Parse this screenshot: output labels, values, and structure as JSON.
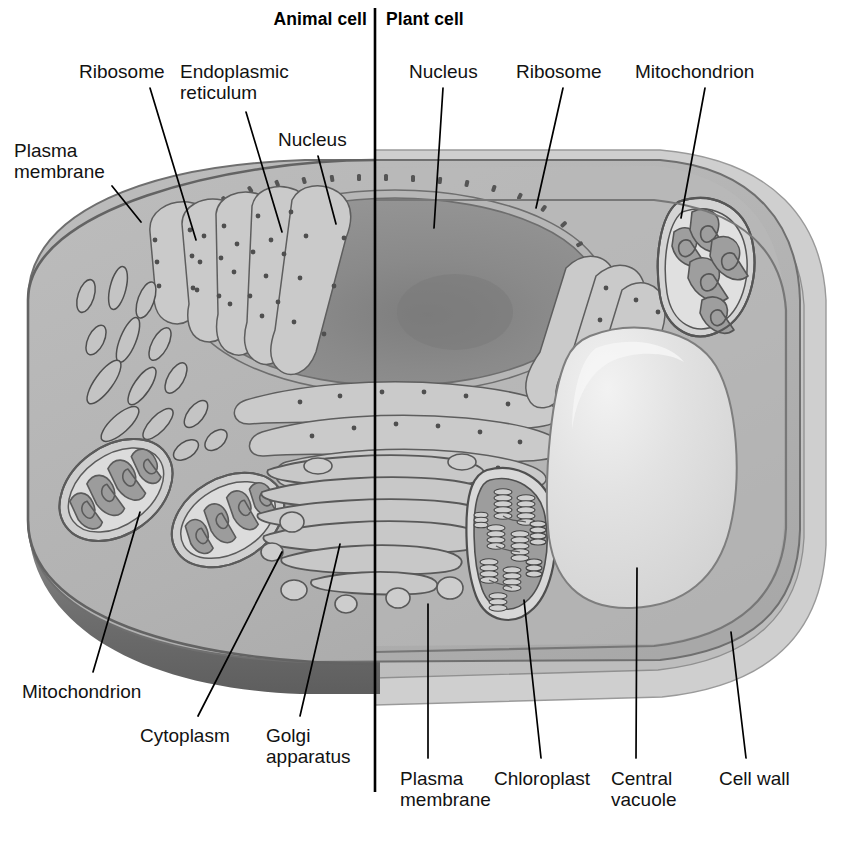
{
  "figure": {
    "title_left": "Animal cell",
    "title_right": "Plant cell",
    "divider": "vertical-divider-line",
    "type": "labeled biological diagram"
  },
  "colors": {
    "background": "#ffffff",
    "text": "#121212",
    "leader_line": "#000000",
    "cytoplasm": "#b3b3b3",
    "cytoplasm_light": "#c2c2c2",
    "organelle_fill": "#a2a2a2",
    "organelle_dark": "#8e8e8e",
    "nucleus": "#8e8e8e",
    "nucleolus": "#7b7b7b",
    "membrane_outline": "#6b6b6b",
    "animal_rim_shadow": "#6f6f6f",
    "cell_wall_outer": "#c9c9c9",
    "cell_wall_mid": "#b8b8b8",
    "vacuole": "#dcdcdc",
    "vacuole_highlight": "#ececec",
    "chloroplast_stroma": "#9a9a9a",
    "granum": "#8a8a8a",
    "lumen_light": "#cfcfcf"
  },
  "labels": {
    "animal": [
      {
        "id": "plasma-membrane",
        "text_lines": [
          "Plasma",
          "membrane"
        ],
        "side": "left-top"
      },
      {
        "id": "ribosome",
        "text_lines": [
          "Ribosome"
        ],
        "side": "top"
      },
      {
        "id": "endoplasmic-reticulum",
        "text_lines": [
          "Endoplasmic",
          "reticulum"
        ],
        "side": "top"
      },
      {
        "id": "nucleus",
        "text_lines": [
          "Nucleus"
        ],
        "side": "top"
      },
      {
        "id": "mitochondrion",
        "text_lines": [
          "Mitochondrion"
        ],
        "side": "bottom-left"
      },
      {
        "id": "cytoplasm",
        "text_lines": [
          "Cytoplasm"
        ],
        "side": "bottom"
      },
      {
        "id": "golgi-apparatus",
        "text_lines": [
          "Golgi",
          "apparatus"
        ],
        "side": "bottom"
      }
    ],
    "plant": [
      {
        "id": "nucleus",
        "text_lines": [
          "Nucleus"
        ],
        "side": "top"
      },
      {
        "id": "ribosome",
        "text_lines": [
          "Ribosome"
        ],
        "side": "top"
      },
      {
        "id": "mitochondrion",
        "text_lines": [
          "Mitochondrion"
        ],
        "side": "top-right"
      },
      {
        "id": "plasma-membrane",
        "text_lines": [
          "Plasma",
          "membrane"
        ],
        "side": "bottom"
      },
      {
        "id": "chloroplast",
        "text_lines": [
          "Chloroplast"
        ],
        "side": "bottom"
      },
      {
        "id": "central-vacuole",
        "text_lines": [
          "Central",
          "vacuole"
        ],
        "side": "bottom"
      },
      {
        "id": "cell-wall",
        "text_lines": [
          "Cell wall"
        ],
        "side": "bottom-right"
      }
    ]
  },
  "label_text": {
    "plasma_membrane_l1": "Plasma",
    "plasma_membrane_l2": "membrane",
    "ribosome": "Ribosome",
    "er_l1": "Endoplasmic",
    "er_l2": "reticulum",
    "nucleus": "Nucleus",
    "mitochondrion": "Mitochondrion",
    "cytoplasm": "Cytoplasm",
    "golgi_l1": "Golgi",
    "golgi_l2": "apparatus",
    "plant_nucleus": "Nucleus",
    "plant_ribosome": "Ribosome",
    "plant_mitochondrion": "Mitochondrion",
    "plant_plasma_membrane_l1": "Plasma",
    "plant_plasma_membrane_l2": "membrane",
    "chloroplast": "Chloroplast",
    "central_vacuole_l1": "Central",
    "central_vacuole_l2": "vacuole",
    "cell_wall": "Cell wall"
  },
  "organelles": {
    "animal_side": [
      "plasma membrane",
      "rough endoplasmic reticulum",
      "ribosomes",
      "nucleus",
      "nucleolus",
      "mitochondria",
      "cytoplasm",
      "Golgi apparatus",
      "vesicles",
      "smooth ER tubules"
    ],
    "plant_side": [
      "cell wall",
      "plasma membrane",
      "nucleus",
      "ribosomes",
      "mitochondrion",
      "chloroplast",
      "central vacuole",
      "cytoplasm",
      "Golgi apparatus"
    ]
  }
}
